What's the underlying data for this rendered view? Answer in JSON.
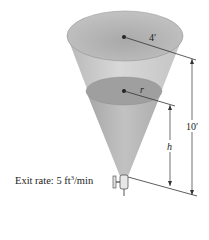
{
  "diagram": {
    "type": "conical tank draining",
    "labels": {
      "top_radius": "4′",
      "water_radius": "r",
      "total_height": "10′",
      "water_height": "h"
    },
    "exit_rate": {
      "prefix": "Exit rate: 5 ft",
      "exponent": "3",
      "suffix": "/min"
    },
    "colors": {
      "cone_fill": "#c9c9c9",
      "top_ellipse": "#b5b5b5",
      "water_surface": "#9d9d9d",
      "water_fill": "#b9b9b9",
      "lines": "#333333"
    }
  }
}
